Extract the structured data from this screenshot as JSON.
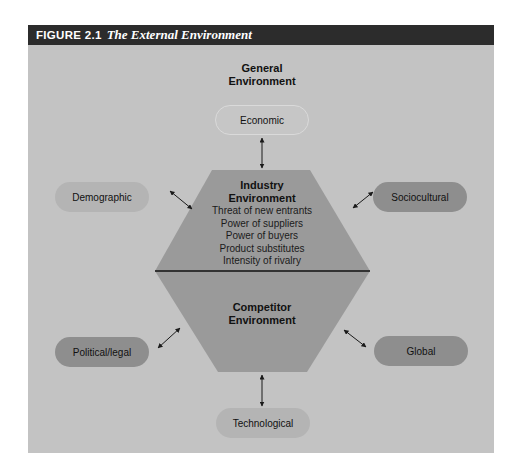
{
  "figure": {
    "number": "FIGURE 2.1",
    "title": "The External Environment"
  },
  "general_environment": {
    "heading_line1": "General",
    "heading_line2": "Environment"
  },
  "segments": {
    "economic": "Economic",
    "demographic": "Demographic",
    "sociocultural": "Sociocultural",
    "political_legal": "Political/legal",
    "global": "Global",
    "technological": "Technological"
  },
  "industry_environment": {
    "heading_line1": "Industry",
    "heading_line2": "Environment",
    "forces": [
      "Threat of new entrants",
      "Power of suppliers",
      "Power of buyers",
      "Product substitutes",
      "Intensity of rivalry"
    ]
  },
  "competitor_environment": {
    "heading_line1": "Competitor",
    "heading_line2": "Environment"
  },
  "colors": {
    "header_bar": "#2c2c2c",
    "panel_background": "#c3c3c3",
    "hexagon_fill": "#9a9a9a",
    "pill_light": "#b4b4b4",
    "pill_dark": "#8e8e8e",
    "divider": "#111111"
  }
}
